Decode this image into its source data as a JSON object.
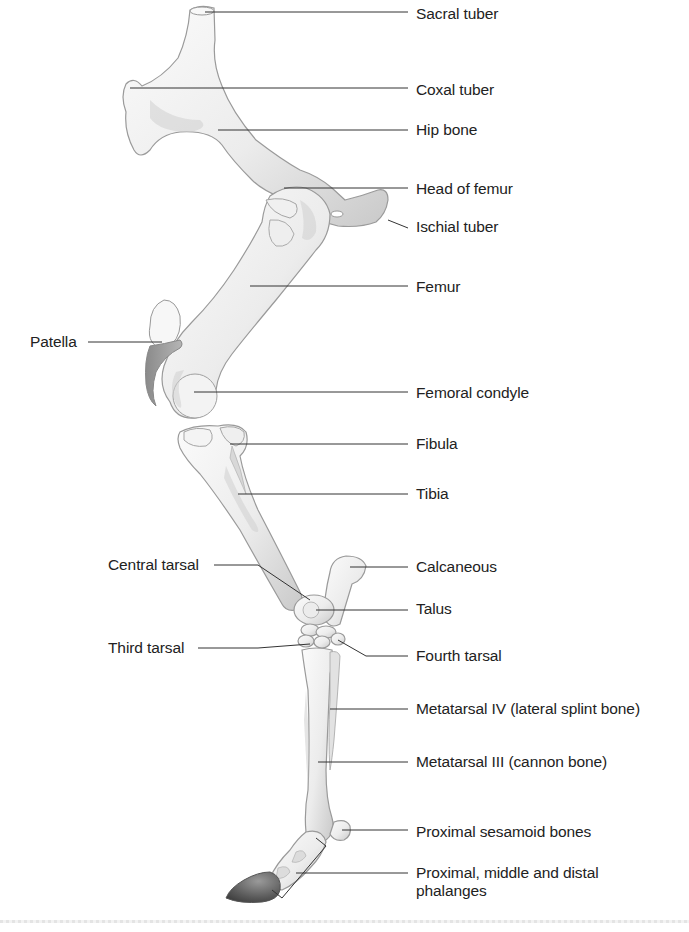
{
  "figure": {
    "colors": {
      "bone_light": "#f4f4f4",
      "bone_mid": "#d6d6d6",
      "bone_outline": "#9a9a9a",
      "hoof": "#4a4a4a",
      "leader_line": "#333333",
      "label_text": "#222222"
    }
  },
  "labels": [
    {
      "id": "sacral-tuber",
      "text": "Sacral tuber",
      "x": 416,
      "y": 5,
      "line": [
        [
          205,
          12
        ],
        [
          408,
          12
        ]
      ]
    },
    {
      "id": "coxal-tuber",
      "text": "Coxal tuber",
      "x": 416,
      "y": 81,
      "line": [
        [
          130,
          88
        ],
        [
          408,
          88
        ]
      ]
    },
    {
      "id": "hip-bone",
      "text": "Hip bone",
      "x": 416,
      "y": 121,
      "line": [
        [
          218,
          130
        ],
        [
          408,
          130
        ]
      ]
    },
    {
      "id": "head-of-femur",
      "text": "Head of femur",
      "x": 416,
      "y": 180,
      "line": [
        [
          284,
          188
        ],
        [
          408,
          188
        ]
      ]
    },
    {
      "id": "ischial-tuber",
      "text": "Ischial tuber",
      "x": 416,
      "y": 218,
      "line": [
        [
          388,
          220
        ],
        [
          408,
          228
        ]
      ]
    },
    {
      "id": "femur",
      "text": "Femur",
      "x": 416,
      "y": 278,
      "line": [
        [
          250,
          286
        ],
        [
          408,
          286
        ]
      ]
    },
    {
      "id": "patella",
      "text": "Patella",
      "x": 30,
      "y": 333,
      "line": [
        [
          88,
          342
        ],
        [
          162,
          342
        ]
      ]
    },
    {
      "id": "femoral-condyle",
      "text": "Femoral condyle",
      "x": 416,
      "y": 384,
      "line": [
        [
          194,
          392
        ],
        [
          408,
          392
        ]
      ]
    },
    {
      "id": "fibula",
      "text": "Fibula",
      "x": 416,
      "y": 435,
      "line": [
        [
          230,
          444
        ],
        [
          408,
          444
        ]
      ]
    },
    {
      "id": "tibia",
      "text": "Tibia",
      "x": 416,
      "y": 485,
      "line": [
        [
          238,
          494
        ],
        [
          408,
          494
        ]
      ]
    },
    {
      "id": "calcaneous",
      "text": "Calcaneous",
      "x": 416,
      "y": 558,
      "line": [
        [
          350,
          567
        ],
        [
          408,
          567
        ]
      ]
    },
    {
      "id": "central-tarsal",
      "text": "Central tarsal",
      "x": 108,
      "y": 556,
      "line": [
        [
          214,
          565
        ],
        [
          258,
          565
        ],
        [
          310,
          600
        ]
      ]
    },
    {
      "id": "talus",
      "text": "Talus",
      "x": 416,
      "y": 600,
      "line": [
        [
          316,
          610
        ],
        [
          408,
          610
        ]
      ]
    },
    {
      "id": "fourth-tarsal",
      "text": "Fourth tarsal",
      "x": 416,
      "y": 647,
      "line": [
        [
          338,
          640
        ],
        [
          366,
          656
        ],
        [
          408,
          656
        ]
      ]
    },
    {
      "id": "third-tarsal",
      "text": "Third tarsal",
      "x": 108,
      "y": 639,
      "line": [
        [
          198,
          648
        ],
        [
          258,
          648
        ],
        [
          310,
          644
        ]
      ]
    },
    {
      "id": "metatarsal-iv",
      "text": "Metatarsal IV (lateral splint bone)",
      "x": 416,
      "y": 700,
      "line": [
        [
          330,
          709
        ],
        [
          408,
          709
        ]
      ]
    },
    {
      "id": "metatarsal-iii",
      "text": "Metatarsal III (cannon bone)",
      "x": 416,
      "y": 753,
      "line": [
        [
          318,
          762
        ],
        [
          408,
          762
        ]
      ]
    },
    {
      "id": "proximal-sesamoid",
      "text": "Proximal sesamoid bones",
      "x": 416,
      "y": 823,
      "line": [
        [
          342,
          830
        ],
        [
          408,
          830
        ]
      ]
    },
    {
      "id": "phalanges",
      "text": "Proximal, middle and distal phalanges",
      "x": 416,
      "y": 864,
      "multiline": true,
      "line": [
        [
          296,
          873
        ],
        [
          408,
          873
        ]
      ]
    }
  ],
  "bracket": {
    "points": [
      [
        316,
        838
      ],
      [
        326,
        846
      ],
      [
        282,
        898
      ],
      [
        272,
        890
      ]
    ]
  }
}
